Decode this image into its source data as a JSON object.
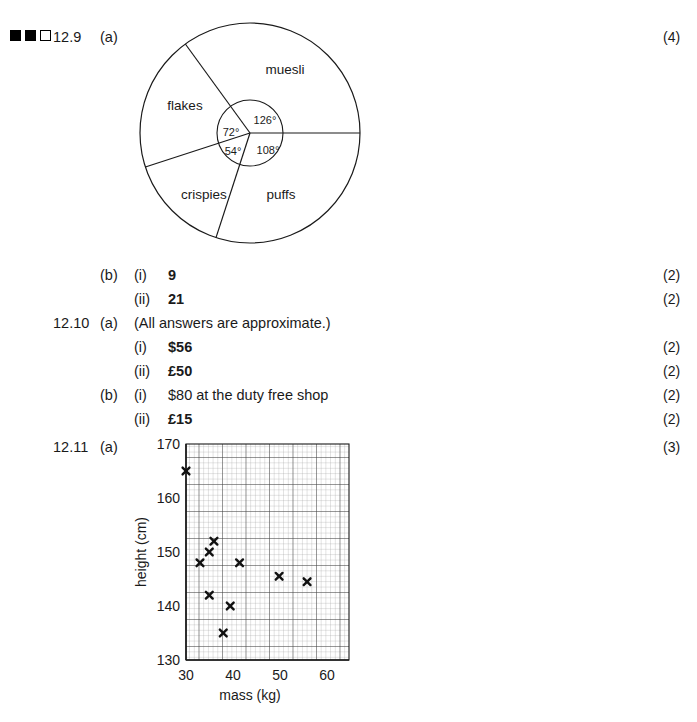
{
  "difficulty": {
    "name": "difficulty-squares",
    "squares": [
      "filled",
      "filled",
      "open"
    ]
  },
  "answers": [
    {
      "number": "12.9",
      "part": "(a)",
      "roman": "",
      "text": "",
      "marks": "(4)"
    },
    {
      "number": "",
      "part": "(b)",
      "roman": "(i)",
      "text": "9",
      "marks": "(2)"
    },
    {
      "number": "",
      "part": "",
      "roman": "(ii)",
      "text": "21",
      "marks": "(2)"
    },
    {
      "number": "12.10",
      "part": "(a)",
      "roman": "",
      "text": "(All answers are approximate.)",
      "marks": ""
    },
    {
      "number": "",
      "part": "",
      "roman": "(i)",
      "text": "$56",
      "marks": "(2)"
    },
    {
      "number": "",
      "part": "",
      "roman": "(ii)",
      "text": "£50",
      "marks": "(2)"
    },
    {
      "number": "",
      "part": "(b)",
      "roman": "(i)",
      "text": "$80 at the duty free shop",
      "marks": "(2)"
    },
    {
      "number": "",
      "part": "",
      "roman": "(ii)",
      "text": "£15",
      "marks": "(2)"
    },
    {
      "number": "12.11",
      "part": "(a)",
      "roman": "",
      "text": "",
      "marks": "(3)"
    }
  ],
  "chart_data": [
    {
      "type": "pie",
      "title": "",
      "categories": [
        "muesli",
        "puffs",
        "crispies",
        "flakes"
      ],
      "values": [
        126,
        108,
        54,
        72
      ],
      "value_labels": [
        "126°",
        "108°",
        "54°",
        "72°"
      ],
      "unit": "degrees",
      "start_angle": 0,
      "direction": "counterclockwise",
      "legend": "none",
      "inner_label_circle": true
    },
    {
      "type": "scatter",
      "title": "",
      "xlabel": "mass (kg)",
      "ylabel": "height (cm)",
      "xlim": [
        30,
        65
      ],
      "ylim": [
        130,
        170
      ],
      "xticks": [
        30,
        40,
        50,
        60
      ],
      "yticks": [
        130,
        140,
        150,
        160,
        170
      ],
      "grid": true,
      "grid_minor_step_x": 1,
      "grid_minor_step_y": 1,
      "marker": "x",
      "points": [
        {
          "x": 30,
          "y": 165
        },
        {
          "x": 33,
          "y": 148
        },
        {
          "x": 35,
          "y": 150
        },
        {
          "x": 36,
          "y": 152
        },
        {
          "x": 35,
          "y": 142
        },
        {
          "x": 38,
          "y": 135
        },
        {
          "x": 39.5,
          "y": 140
        },
        {
          "x": 41.5,
          "y": 148
        },
        {
          "x": 50,
          "y": 145.5
        },
        {
          "x": 56,
          "y": 144.5
        }
      ]
    }
  ]
}
